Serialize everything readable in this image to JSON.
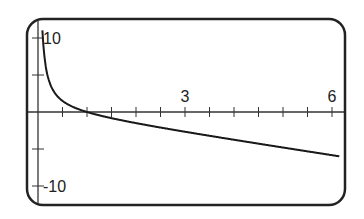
{
  "chart_data": {
    "type": "line",
    "title": "",
    "xlabel": "",
    "ylabel": "",
    "function": "y = 1/x - x",
    "xlim": [
      -0.2,
      6.3
    ],
    "ylim": [
      -11.5,
      12.5
    ],
    "grid": false,
    "legend": null,
    "x_tick_step": 0.5,
    "y_tick_step": 5,
    "x_tick_labels": [
      {
        "value": 3,
        "label": "3"
      },
      {
        "value": 6,
        "label": "6"
      }
    ],
    "y_tick_labels": [
      {
        "value": 10,
        "label": "10"
      },
      {
        "value": -10,
        "label": "-10"
      }
    ],
    "series": [
      {
        "name": "f(x)",
        "x": [
          0.08,
          0.1,
          0.15,
          0.2,
          0.3,
          0.5,
          0.75,
          1,
          1.5,
          2,
          3,
          4,
          5,
          6
        ],
        "y": [
          12.42,
          9.9,
          6.52,
          4.8,
          3.03,
          1.5,
          0.58,
          0,
          -0.83,
          -1.5,
          -2.67,
          -3.75,
          -4.8,
          -5.83
        ]
      }
    ],
    "colors": {
      "frame": "#222222",
      "curve": "#1a1a1a",
      "axes": "#333333"
    }
  }
}
